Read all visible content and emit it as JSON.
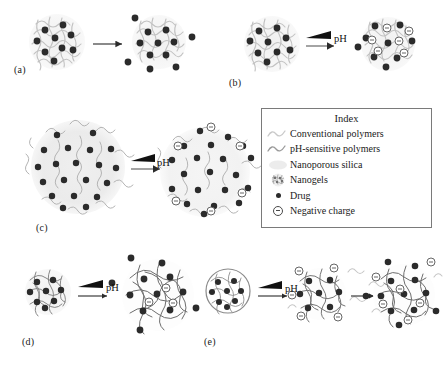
{
  "figure": {
    "type": "scientific-schematic",
    "panels": [
      {
        "id": "a",
        "label": "(a)",
        "arrow_label": "",
        "stages": 2,
        "stimulus": "none"
      },
      {
        "id": "b",
        "label": "(b)",
        "arrow_label": "pH",
        "stages": 2,
        "stimulus": "pH"
      },
      {
        "id": "c",
        "label": "(c)",
        "arrow_label": "pH",
        "stages": 2,
        "stimulus": "pH"
      },
      {
        "id": "d",
        "label": "(d)",
        "arrow_label": "pH",
        "stages": 2,
        "stimulus": "pH"
      },
      {
        "id": "e",
        "label": "(e)",
        "arrow_label": "pH",
        "stages": 3,
        "stimulus": "pH"
      }
    ]
  },
  "index": {
    "title": "Index",
    "items": [
      {
        "icon": "conventional-polymer-squiggle",
        "label": "Conventional polymers",
        "color": "#c8c8c8"
      },
      {
        "icon": "ph-sensitive-polymer-squiggle",
        "label": "pH-sensitive polymers",
        "color": "#9a9a9a"
      },
      {
        "icon": "nanoporous-silica-blob",
        "label": "Nanoporous silica",
        "color": "#e8e8e8"
      },
      {
        "icon": "nanogel-cluster",
        "label": "Nanogels",
        "color": "#b0b0b0"
      },
      {
        "icon": "drug-dot",
        "label": "Drug",
        "color": "#2b2b2b"
      },
      {
        "icon": "negative-charge-circle",
        "label": "Negative charge",
        "color": "#4a4a4a"
      }
    ]
  },
  "arrows": {
    "ph_label": "pH"
  },
  "colors": {
    "drug": "#2b2b2b",
    "negative_charge": "#4a4a4a",
    "conventional_polymer": "#c9c9c9",
    "ph_sensitive_polymer": "#8f8f8f",
    "silica": "#ededed",
    "arrow": "#2b2b2b",
    "index_border": "#7a7a7a",
    "background": "#ffffff"
  }
}
